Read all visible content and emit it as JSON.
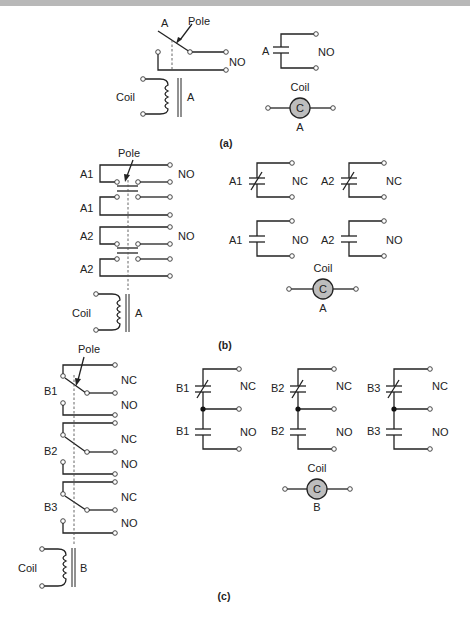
{
  "figure": {
    "panels": [
      {
        "id": "a",
        "caption": "(a)",
        "relay": {
          "contact_label": "A",
          "pole_label": "Pole",
          "contact_type": "NO",
          "coil_label": "Coil",
          "coil_id": "A"
        },
        "symbols": {
          "contacts": [
            {
              "label": "A",
              "type": "NO"
            }
          ],
          "coil": {
            "title": "Coil",
            "glyph": "C",
            "id": "A"
          }
        }
      },
      {
        "id": "b",
        "caption": "(b)",
        "relay": {
          "pole_label": "Pole",
          "contacts": [
            {
              "label": "A1",
              "type": "NO"
            },
            {
              "label": "A1",
              "type": ""
            },
            {
              "label": "A2",
              "type": "NO"
            },
            {
              "label": "A2",
              "type": ""
            }
          ],
          "coil_label": "Coil",
          "coil_id": "A"
        },
        "symbols": {
          "contacts": [
            {
              "label": "A1",
              "type": "NC"
            },
            {
              "label": "A2",
              "type": "NC"
            },
            {
              "label": "A1",
              "type": "NO"
            },
            {
              "label": "A2",
              "type": "NO"
            }
          ],
          "coil": {
            "title": "Coil",
            "glyph": "C",
            "id": "A"
          }
        }
      },
      {
        "id": "c",
        "caption": "(c)",
        "relay": {
          "pole_label": "Pole",
          "contacts": [
            {
              "label": "B1",
              "nc": "NC",
              "no": "NO"
            },
            {
              "label": "B2",
              "nc": "NC",
              "no": "NO"
            },
            {
              "label": "B3",
              "nc": "NC",
              "no": "NO"
            }
          ],
          "coil_label": "Coil",
          "coil_id": "B"
        },
        "symbols": {
          "contacts": [
            {
              "label": "B1",
              "nc": "NC",
              "no": "NO"
            },
            {
              "label": "B2",
              "nc": "NC",
              "no": "NO"
            },
            {
              "label": "B3",
              "nc": "NC",
              "no": "NO"
            }
          ],
          "coil": {
            "title": "Coil",
            "glyph": "C",
            "id": "B"
          }
        }
      }
    ]
  }
}
